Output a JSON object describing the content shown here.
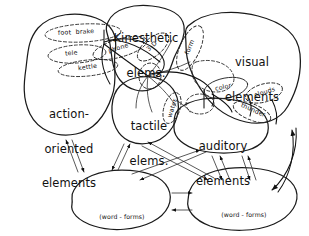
{
  "diagram": {
    "style": "hand-drawn line diagram, black ink on white",
    "major_nodes": [
      {
        "id": "action",
        "label_line1": "action-",
        "label_line2": "oriented",
        "label_line3": "elements"
      },
      {
        "id": "kinesthetic",
        "label_line1": "Kinesthetic",
        "label_line2": "elems.",
        "label_line3": ""
      },
      {
        "id": "tactile",
        "label_line1": "tactile",
        "label_line2": "elems.",
        "label_line3": ""
      },
      {
        "id": "visual",
        "label_line1": "visual",
        "label_line2": "elements",
        "label_line3": ""
      },
      {
        "id": "auditory",
        "label_line1": "auditory",
        "label_line2": "elements",
        "label_line3": ""
      },
      {
        "id": "phonologic",
        "label_line0": "(word - forms)",
        "label_line1": "phonologic",
        "label_line2": "elements",
        "label_line3": ""
      },
      {
        "id": "orthographic",
        "label_line0": "(word - forms)",
        "label_line1": "orthographic",
        "label_line2": "elements",
        "label_line3": ""
      }
    ],
    "concept_bubbles": [
      {
        "id": "foot-brake",
        "label": "foot  brake"
      },
      {
        "id": "tele",
        "label": "tele"
      },
      {
        "id": "kettle",
        "label": "kettle"
      },
      {
        "id": "phone",
        "label": "phone"
      },
      {
        "id": "three-d",
        "label": "3-D"
      },
      {
        "id": "form",
        "label": "form"
      },
      {
        "id": "water",
        "label": "water"
      },
      {
        "id": "color",
        "label": "color"
      },
      {
        "id": "clouds",
        "label": "clouds"
      },
      {
        "id": "thunder",
        "label": "thunder"
      }
    ],
    "colors": {
      "ink": "#111111",
      "paper": "#ffffff"
    }
  }
}
